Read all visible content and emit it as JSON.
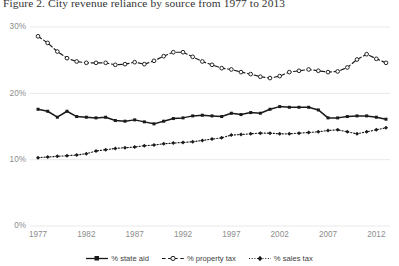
{
  "figure": {
    "title": "Figure 2. City revenue reliance by source from 1977 to 2013"
  },
  "axes": {
    "y_ticks": [
      "0%",
      "10%",
      "20%",
      "30%"
    ],
    "x_ticks": [
      "1977",
      "1982",
      "1987",
      "1992",
      "1997",
      "2002",
      "2007",
      "2012"
    ]
  },
  "legend": {
    "items": [
      {
        "label": "% state aid",
        "marker": "filled-square-solid-line",
        "color": "#1a1a1a"
      },
      {
        "label": "% property tax",
        "marker": "open-circle-dashed-line",
        "color": "#1a1a1a"
      },
      {
        "label": "% sales tax",
        "marker": "filled-diamond-dotted-line",
        "color": "#1a1a1a"
      }
    ]
  },
  "chart_data": {
    "type": "line",
    "title": "Figure 2. City revenue reliance by source from 1977 to 2013",
    "xlabel": "",
    "ylabel": "",
    "ylim": [
      0,
      30
    ],
    "yticks": [
      0,
      10,
      20,
      30
    ],
    "ytick_labels": [
      "0%",
      "10%",
      "20%",
      "30%"
    ],
    "xlim": [
      1977,
      2013
    ],
    "xticks": [
      1977,
      1982,
      1987,
      1992,
      1997,
      2002,
      2007,
      2012
    ],
    "grid": "horizontal",
    "legend_position": "bottom-center",
    "x": [
      1977,
      1978,
      1979,
      1980,
      1981,
      1982,
      1983,
      1984,
      1985,
      1986,
      1987,
      1988,
      1989,
      1990,
      1991,
      1992,
      1993,
      1994,
      1995,
      1996,
      1997,
      1998,
      1999,
      2000,
      2001,
      2002,
      2003,
      2004,
      2005,
      2006,
      2007,
      2008,
      2009,
      2010,
      2011,
      2012,
      2013
    ],
    "series": [
      {
        "name": "% state aid",
        "style": "solid",
        "marker": "filled-square",
        "color": "#1a1a1a",
        "values": [
          17.6,
          17.3,
          16.4,
          17.3,
          16.5,
          16.4,
          16.3,
          16.4,
          15.9,
          15.8,
          16.0,
          15.7,
          15.4,
          15.8,
          16.2,
          16.3,
          16.6,
          16.7,
          16.6,
          16.5,
          17.0,
          16.8,
          17.1,
          17.0,
          17.6,
          18.0,
          17.9,
          17.9,
          17.9,
          17.5,
          16.3,
          16.3,
          16.5,
          16.6,
          16.6,
          16.4,
          16.1
        ]
      },
      {
        "name": "% property tax",
        "style": "dashed",
        "marker": "open-circle",
        "color": "#1a1a1a",
        "values": [
          28.6,
          27.6,
          26.3,
          25.3,
          24.8,
          24.6,
          24.6,
          24.6,
          24.3,
          24.4,
          24.7,
          24.4,
          24.9,
          25.6,
          26.2,
          26.2,
          25.5,
          24.8,
          24.3,
          23.8,
          23.6,
          23.2,
          22.9,
          22.5,
          22.3,
          22.6,
          23.2,
          23.4,
          23.6,
          23.4,
          23.2,
          23.3,
          23.9,
          25.1,
          25.9,
          25.2,
          24.6
        ]
      },
      {
        "name": "% sales tax",
        "style": "dotted",
        "marker": "filled-diamond",
        "color": "#1a1a1a",
        "values": [
          10.3,
          10.4,
          10.5,
          10.6,
          10.7,
          10.9,
          11.3,
          11.5,
          11.7,
          11.8,
          11.9,
          12.1,
          12.2,
          12.4,
          12.5,
          12.6,
          12.7,
          12.9,
          13.1,
          13.3,
          13.7,
          13.8,
          13.9,
          14.0,
          14.0,
          13.9,
          13.9,
          14.0,
          14.1,
          14.2,
          14.4,
          14.5,
          14.2,
          13.9,
          14.2,
          14.5,
          14.8
        ]
      }
    ]
  }
}
